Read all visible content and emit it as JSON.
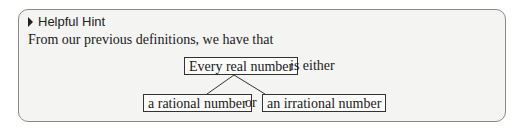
{
  "hint": {
    "icon": "triangle-right-icon",
    "title": "Helpful Hint",
    "intro": "From our previous definitions, we have that"
  },
  "diagram": {
    "root": "Every real number",
    "root_suffix": "is either",
    "left": "a rational number",
    "connector": "or",
    "right": "an irrational number"
  }
}
